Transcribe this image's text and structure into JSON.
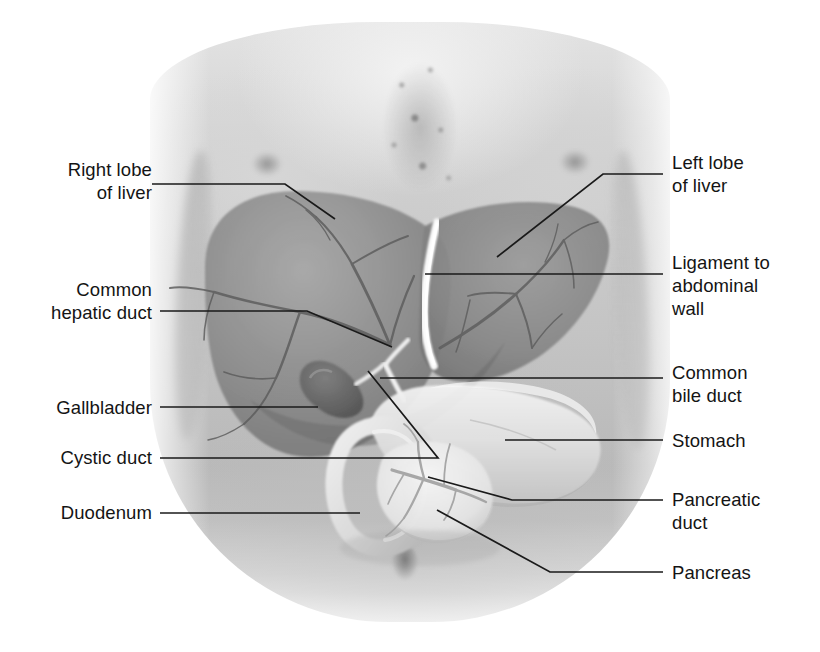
{
  "figure": {
    "kind": "anatomy-illustration",
    "background": "grayscale photograph of a male torso, head and legs cropped",
    "palette": {
      "label_text": "#141414",
      "leader_line": "#1a1a1a",
      "skin_light": "#e3e3e3",
      "skin_mid": "#c4c4c4",
      "skin_shadow": "#b0b0b0",
      "liver": "#8f8f8f",
      "liver_dark": "#6f6f6f",
      "liver_vessel": "#5e5e5e",
      "gallbladder": "#6a6a6a",
      "stomach": "#e6e6e6",
      "duodenum": "#dcdcdc",
      "pancreas": "#ededed",
      "ligament_white": "#fbfbfb",
      "page_background": "#ffffff"
    }
  },
  "labels": {
    "left": [
      {
        "id": "right-lobe-of-liver",
        "text": "Right lobe\nof liver",
        "x": 60,
        "y": 158
      },
      {
        "id": "common-hepatic-duct",
        "text": "Common\nhepatic duct",
        "x": 72,
        "y": 278
      },
      {
        "id": "gallbladder",
        "text": "Gallbladder",
        "x": 44,
        "y": 396
      },
      {
        "id": "cystic-duct",
        "text": "Cystic duct",
        "x": 48,
        "y": 446
      },
      {
        "id": "duodenum",
        "text": "Duodenum",
        "x": 50,
        "y": 500
      }
    ],
    "right": [
      {
        "id": "left-lobe-of-liver",
        "text": "Left lobe\nof liver",
        "x": 672,
        "y": 152
      },
      {
        "id": "ligament-to-abdominal-wall",
        "text": "Ligament to\nabdominal\nwall",
        "x": 672,
        "y": 252
      },
      {
        "id": "common-bile-duct",
        "text": "Common\nbile duct",
        "x": 672,
        "y": 362
      },
      {
        "id": "stomach",
        "text": "Stomach",
        "x": 672,
        "y": 427
      },
      {
        "id": "pancreatic-duct",
        "text": "Pancreatic\nduct",
        "x": 672,
        "y": 487
      },
      {
        "id": "pancreas",
        "text": "Pancreas",
        "x": 672,
        "y": 560
      }
    ]
  },
  "leader_lines": [
    {
      "id": "leader-right-lobe-of-liver",
      "points": "152,184 285,184 335,219"
    },
    {
      "id": "leader-common-hepatic-duct",
      "points": "160,311 307,311 392,347"
    },
    {
      "id": "leader-gallbladder",
      "points": "160,407 318,407"
    },
    {
      "id": "leader-cystic-duct",
      "points": "160,458 438,458 368,371"
    },
    {
      "id": "leader-duodenum",
      "points": "160,513 360,513"
    },
    {
      "id": "leader-left-lobe-of-liver",
      "points": "497,257 603,174 663,174"
    },
    {
      "id": "leader-ligament-to-abdominal-wall",
      "points": "425,274 663,274"
    },
    {
      "id": "leader-common-bile-duct",
      "points": "380,378 663,378"
    },
    {
      "id": "leader-stomach",
      "points": "505,440 663,440"
    },
    {
      "id": "leader-pancreatic-duct",
      "points": "428,477 512,500 663,500"
    },
    {
      "id": "leader-pancreas",
      "points": "437,510 550,572 663,572"
    }
  ],
  "organ_parts": [
    {
      "id": "liver-right-lobe",
      "name": "Right lobe of liver"
    },
    {
      "id": "liver-left-lobe",
      "name": "Left lobe of liver"
    },
    {
      "id": "falciform-ligament",
      "name": "Ligament to abdominal wall"
    },
    {
      "id": "common-hepatic-duct-structure",
      "name": "Common hepatic duct"
    },
    {
      "id": "common-bile-duct-structure",
      "name": "Common bile duct"
    },
    {
      "id": "cystic-duct-structure",
      "name": "Cystic duct"
    },
    {
      "id": "gallbladder-body",
      "name": "Gallbladder"
    },
    {
      "id": "stomach-body",
      "name": "Stomach"
    },
    {
      "id": "duodenum-loop",
      "name": "Duodenum"
    },
    {
      "id": "pancreas-body",
      "name": "Pancreas"
    },
    {
      "id": "pancreatic-duct-structure",
      "name": "Pancreatic duct"
    }
  ]
}
